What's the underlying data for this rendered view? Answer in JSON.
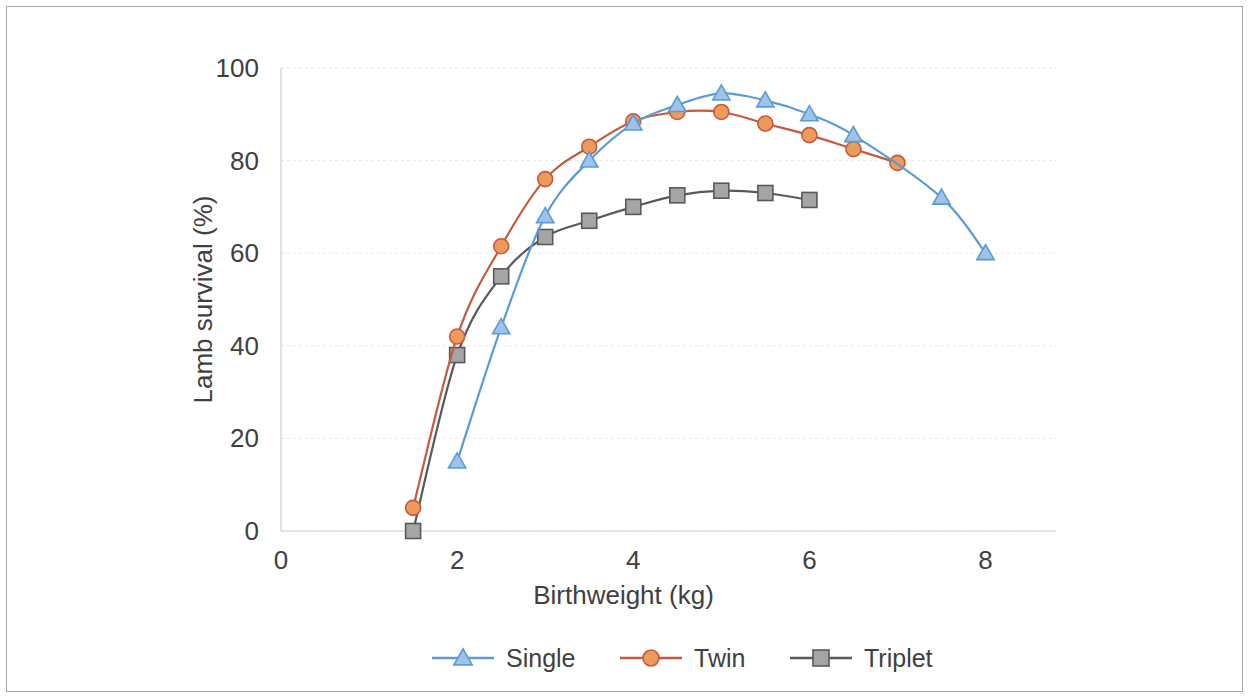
{
  "chart_data": {
    "type": "line",
    "title": "",
    "xlabel": "Birthweight (kg)",
    "ylabel": "Lamb survival (%)",
    "xlim": [
      0,
      8.8
    ],
    "ylim": [
      0,
      100
    ],
    "xticks": [
      0,
      2,
      4,
      6,
      8
    ],
    "yticks": [
      0,
      20,
      40,
      60,
      80,
      100
    ],
    "xtick_labels": [
      "0",
      "2",
      "4",
      "6",
      "8"
    ],
    "ytick_labels": [
      "0",
      "20",
      "40",
      "60",
      "80",
      "100"
    ],
    "grid": "horizontal",
    "legend_position": "bottom",
    "series": [
      {
        "name": "Single",
        "color": "#5B9BD5",
        "marker": "triangle",
        "marker_fill": "#9DC3E6",
        "x": [
          2,
          2.5,
          3,
          3.5,
          4,
          4.5,
          5,
          5.5,
          6,
          6.5,
          7.5,
          8
        ],
        "values": [
          15,
          44,
          68,
          80,
          88,
          92,
          94.5,
          93,
          90,
          85.5,
          72,
          60
        ]
      },
      {
        "name": "Twin",
        "color": "#C55A3C",
        "marker": "circle",
        "marker_fill": "#ED9A5C",
        "x": [
          1.5,
          2,
          2.5,
          3,
          3.5,
          4,
          4.5,
          5,
          5.5,
          6,
          6.5,
          7
        ],
        "values": [
          5,
          42,
          61.5,
          76,
          83,
          88.5,
          90.5,
          90.5,
          88,
          85.5,
          82.5,
          79.5
        ]
      },
      {
        "name": "Triplet",
        "color": "#595959",
        "marker": "square",
        "marker_fill": "#A5A5A5",
        "x": [
          1.5,
          2,
          2.5,
          3,
          3.5,
          4,
          4.5,
          5,
          5.5,
          6
        ],
        "values": [
          0,
          38,
          55,
          63.5,
          67,
          70,
          72.5,
          73.5,
          73,
          71.5
        ]
      }
    ]
  },
  "legend": {
    "items": [
      {
        "label": "Single"
      },
      {
        "label": "Twin"
      },
      {
        "label": "Triplet"
      }
    ]
  }
}
